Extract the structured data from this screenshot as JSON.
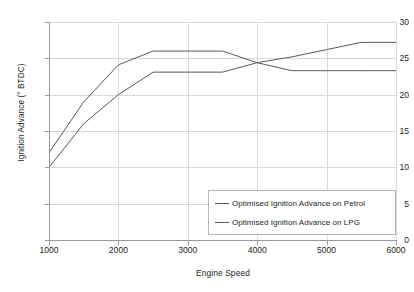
{
  "chart_data": {
    "type": "line",
    "title": "",
    "xlabel": "Engine Speed",
    "ylabel": "Ignition Advance (° BTDC)",
    "xlim": [
      1000,
      6000
    ],
    "ylim": [
      0,
      30
    ],
    "xticks": [
      1000,
      2000,
      3000,
      4000,
      5000,
      6000
    ],
    "yticks": [
      0,
      5,
      10,
      15,
      20,
      25,
      30
    ],
    "xtick_labels": [
      "1000",
      "2000",
      "3000",
      "4000",
      "5000",
      "6000"
    ],
    "ytick_labels": [
      "0",
      "5",
      "10",
      "15",
      "20",
      "25",
      "30"
    ],
    "grid": true,
    "legend_position": "lower right",
    "x": [
      1000,
      1500,
      2000,
      2500,
      3000,
      3500,
      4000,
      4500,
      5000,
      5500,
      6000
    ],
    "series": [
      {
        "name": "Optimised Ignition Advance on Petrol",
        "color": "#595959",
        "values": [
          12.0,
          19.0,
          24.1,
          26.0,
          26.0,
          26.0,
          24.4,
          23.3,
          23.3,
          23.3,
          23.3
        ]
      },
      {
        "name": "Optimised Ignition Advance on LPG",
        "color": "#595959",
        "values": [
          10.0,
          16.0,
          20.0,
          23.1,
          23.1,
          23.1,
          24.4,
          25.2,
          26.2,
          27.2,
          27.2
        ]
      }
    ]
  },
  "legend": {
    "items": [
      {
        "label": "Optimised Ignition Advance on Petrol"
      },
      {
        "label": "Optimised Ignition Advance on LPG"
      }
    ]
  },
  "axes": {
    "x_title": "Engine Speed",
    "y_title": "Ignition Advance (° BTDC)"
  }
}
